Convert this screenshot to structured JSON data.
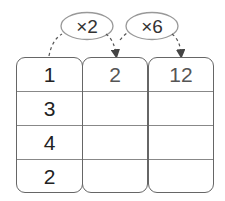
{
  "operators": [
    {
      "label": "×2",
      "from_col": 0,
      "to_col": 1
    },
    {
      "label": "×6",
      "from_col": 1,
      "to_col": 2
    }
  ],
  "table": {
    "columns": [
      {
        "values": [
          "1",
          "3",
          "4",
          "2"
        ]
      },
      {
        "values": [
          "2",
          "",
          "",
          ""
        ]
      },
      {
        "values": [
          "12",
          "",
          "",
          ""
        ]
      }
    ]
  }
}
